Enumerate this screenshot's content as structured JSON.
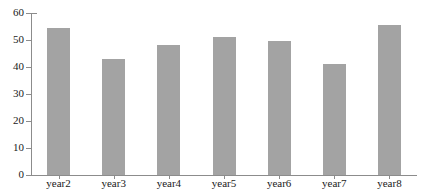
{
  "chart_data": {
    "type": "bar",
    "title": "",
    "subtitle": "",
    "xlabel": "",
    "ylabel": "",
    "categories": [
      "year2",
      "year3",
      "year4",
      "year5",
      "year6",
      "year7",
      "year8"
    ],
    "values": [
      54.5,
      43.0,
      48.0,
      51.0,
      49.5,
      41.0,
      55.5
    ],
    "series": [
      {
        "name": "",
        "values": [
          54.5,
          43.0,
          48.0,
          51.0,
          49.5,
          41.0,
          55.5
        ]
      }
    ],
    "ylim": [
      0,
      60
    ],
    "yticks": [
      0,
      10,
      20,
      30,
      40,
      50,
      60
    ],
    "ytick_labels": [
      "0",
      "10",
      "20",
      "30",
      "40",
      "50",
      "60"
    ],
    "grid": false,
    "legend": null,
    "legend_position": "none",
    "bar_color": "#a3a3a3",
    "axis_color": "#8c8c8c",
    "text_color": "#1a1a1a",
    "background": "#ffffff",
    "annotations": []
  }
}
